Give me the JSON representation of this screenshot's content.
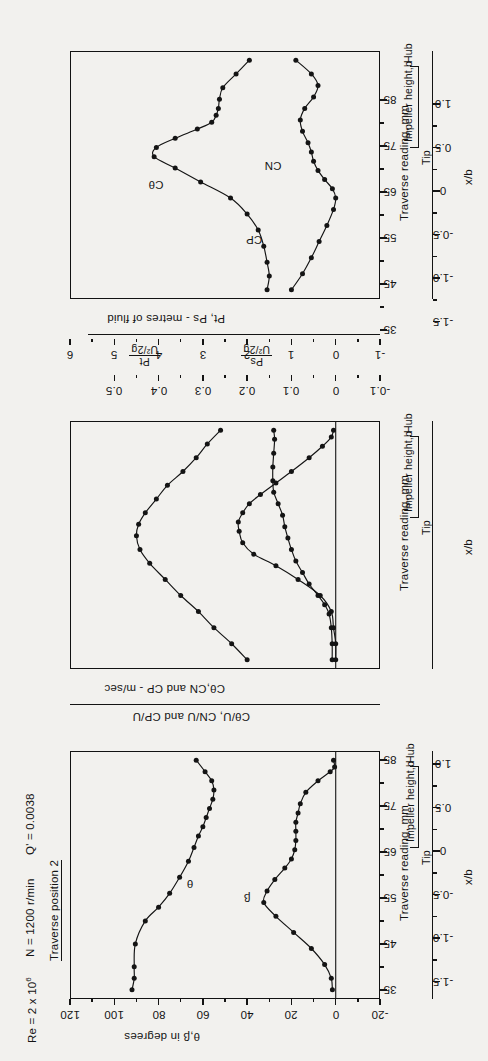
{
  "figure": {
    "orientation": "rotated-90-ccw",
    "header": {
      "reynolds": "Re = 2 x 10",
      "reynolds_exp": "6",
      "speed": "N = 1200 r/min",
      "flow": "Q' = 0.0038",
      "traverse": "Traverse position 2"
    },
    "shared_x": {
      "primary_title": "Traverse reading, mm",
      "primary_ticks": [
        "35",
        "45",
        "55",
        "65",
        "75",
        "85"
      ],
      "secondary_title": "x/b",
      "secondary_ticks": [
        "-1.5",
        "-1.0",
        "-0.5",
        "0",
        "0.5",
        "1.0"
      ],
      "span_label": "Impeller height,b",
      "span_start": "Tip",
      "span_end": "Hub"
    },
    "ink_color": "#141414",
    "paper_color": "#f2f1ee"
  },
  "chart_data": [
    {
      "id": "panel-angles",
      "type": "line",
      "title": "",
      "xlabel": "Traverse reading, mm",
      "ylabel": "θ,β in degrees",
      "xlim": [
        33,
        87
      ],
      "ylim": [
        -20,
        120
      ],
      "yticks": [
        "120",
        "100",
        "80",
        "60",
        "40",
        "20",
        "0",
        "-20"
      ],
      "ytick_values": [
        120,
        100,
        80,
        60,
        40,
        20,
        0,
        -20
      ],
      "x2lim": [
        -1.7,
        1.15
      ],
      "series": [
        {
          "name": "θ",
          "label": "θ",
          "x": [
            35,
            37.5,
            40,
            45,
            50,
            53,
            56,
            59.5,
            63,
            66,
            68.5,
            70.5,
            72.5,
            74.5,
            76.5,
            78.5,
            80.5,
            82.5,
            85
          ],
          "y": [
            92,
            91,
            91,
            90.5,
            86,
            80,
            75,
            70.5,
            66.5,
            64,
            62,
            60,
            58.5,
            57,
            55.5,
            55,
            56,
            59,
            63
          ]
        },
        {
          "name": "β",
          "label": "β",
          "x": [
            35,
            37.5,
            40.5,
            44,
            47.5,
            51,
            54,
            56.5,
            59,
            61.5,
            63.5,
            65.5,
            67.5,
            69.5,
            71.5,
            73.5,
            75.5,
            78,
            80.5,
            82.5,
            83.5,
            85
          ],
          "y": [
            1.5,
            2,
            5,
            11,
            19,
            27,
            32.5,
            31,
            27.5,
            23,
            20,
            18.5,
            18,
            18,
            18,
            17,
            16,
            13.5,
            8,
            2.5,
            0.5,
            1
          ]
        }
      ]
    },
    {
      "id": "panel-velocities",
      "type": "line",
      "title": "",
      "xlabel": "Traverse reading, mm",
      "ylabel": "Cθ,CN and CP - m/sec",
      "ylabel2": "Cθ/U, CN/U and CP/U",
      "xlim": [
        33,
        87
      ],
      "ylim": [
        -1,
        6
      ],
      "yticks": [
        "6",
        "5",
        "4",
        "3",
        "2",
        "1",
        "0",
        "-1"
      ],
      "ytick_values": [
        6,
        5,
        4,
        3,
        2,
        1,
        0,
        -1
      ],
      "y2ticks": [
        "0.5",
        "0.4",
        "0.3",
        "0.2",
        "0.1",
        "0",
        "-0.1"
      ],
      "y2tick_values": [
        0.5,
        0.4,
        0.3,
        0.2,
        0.1,
        0,
        -0.1
      ],
      "series": [
        {
          "name": "Cθ",
          "label": "Cθ",
          "x": [
            35,
            38.5,
            42,
            45.5,
            49,
            52.5,
            56,
            59,
            62,
            64.5,
            67,
            70,
            73,
            76,
            79,
            82,
            85
          ],
          "y": [
            2.0,
            2.35,
            2.75,
            3.1,
            3.5,
            3.85,
            4.2,
            4.42,
            4.5,
            4.45,
            4.3,
            4.05,
            3.8,
            3.45,
            3.15,
            2.9,
            2.6
          ]
        },
        {
          "name": "CN",
          "label": "CN",
          "x": [
            35,
            38.5,
            42,
            45,
            47,
            49,
            51.5,
            54,
            56.5,
            59,
            61.5,
            64,
            66.5,
            69,
            71.5,
            74,
            77,
            80,
            83,
            85
          ],
          "y": [
            0.08,
            0.08,
            0.1,
            0.15,
            0.25,
            0.4,
            0.6,
            0.75,
            0.9,
            1.0,
            1.08,
            1.15,
            1.2,
            1.3,
            1.4,
            1.42,
            1.42,
            1.4,
            1.38,
            1.4
          ]
        },
        {
          "name": "CP",
          "label": "CP",
          "x": [
            35,
            38.5,
            42,
            45.5,
            49,
            52.5,
            55.5,
            58,
            60.5,
            63,
            65,
            67,
            69,
            71,
            73.5,
            76,
            79,
            81.5,
            83.5,
            85
          ],
          "y": [
            0.0,
            0.0,
            0.05,
            0.1,
            0.35,
            0.85,
            1.35,
            1.85,
            2.1,
            2.18,
            2.2,
            2.1,
            1.95,
            1.7,
            1.35,
            1.0,
            0.6,
            0.3,
            0.1,
            0.05
          ]
        }
      ]
    },
    {
      "id": "panel-pressures",
      "type": "line",
      "title": "",
      "xlabel": "Traverse reading, mm",
      "ylabel": "Pt, Ps - metres of fluid",
      "ylabel2_numer": "Pt",
      "ylabel2_denom": "U²/2g",
      "ylabel3_numer": "Ps",
      "ylabel3_denom": "U²/2g",
      "xlim": [
        33,
        87
      ],
      "ylim": [
        2.2,
        5.0
      ],
      "yticks": [
        "5.0",
        "4.6",
        "4.2",
        "3.8",
        "3.4",
        "3.0",
        "2.6",
        "2.2"
      ],
      "ytick_values": [
        5.0,
        4.6,
        4.2,
        3.8,
        3.4,
        3.0,
        2.6,
        2.2
      ],
      "y2ticks": [
        "0.8",
        "0.7",
        "0.6",
        "0.5",
        "0.4"
      ],
      "y2tick_values": [
        0.8,
        0.7,
        0.6,
        0.5,
        0.4
      ],
      "series": [
        {
          "name": "Pt",
          "label": "Pt",
          "x": [
            35,
            38,
            41,
            44.5,
            48,
            51.5,
            55,
            58.5,
            61.5,
            64,
            66,
            68,
            70,
            71.5,
            73,
            74.5,
            76.5,
            79,
            82,
            85
          ],
          "y": [
            3.22,
            3.2,
            3.22,
            3.25,
            3.3,
            3.4,
            3.55,
            3.82,
            4.05,
            4.24,
            4.22,
            4.05,
            3.85,
            3.72,
            3.68,
            3.66,
            3.65,
            3.62,
            3.5,
            3.38
          ]
        },
        {
          "name": "Ps",
          "label": "Ps",
          "x": [
            35,
            38.5,
            42,
            45.5,
            49,
            52.5,
            55,
            57,
            59,
            61,
            63,
            65,
            67,
            69.5,
            72,
            74.5,
            77,
            79.5,
            82,
            85
          ],
          "y": [
            3.0,
            2.9,
            2.82,
            2.75,
            2.68,
            2.62,
            2.6,
            2.63,
            2.7,
            2.76,
            2.8,
            2.82,
            2.85,
            2.9,
            2.92,
            2.88,
            2.8,
            2.76,
            2.82,
            2.96
          ]
        }
      ]
    }
  ]
}
